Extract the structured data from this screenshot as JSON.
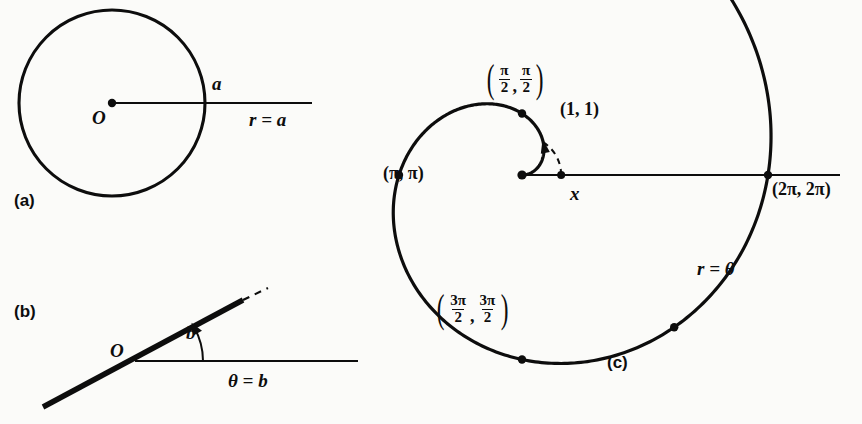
{
  "figure": {
    "caption_tags": {
      "a": "(a)",
      "b": "(b)",
      "c": "(c)"
    },
    "ink_color": "#0d0d0d",
    "paper_color": "#fbfbf9"
  },
  "panel_a": {
    "name": "circle r = a",
    "equation_label": "r = a",
    "origin_label": "O",
    "radius_label": "a",
    "geometry": {
      "center": [
        112,
        103
      ],
      "radius": 93,
      "ray_end_x": 312
    }
  },
  "panel_b": {
    "name": "line theta = b",
    "equation_label": "θ = b",
    "origin_label": "O",
    "angle_label": "b",
    "geometry": {
      "vertex": [
        135,
        361
      ],
      "line_start": [
        43,
        407
      ],
      "line_end": [
        243,
        300
      ],
      "dash_end": [
        268,
        288
      ],
      "axis_end_x": 358,
      "angle_arc_radius": 68
    }
  },
  "panel_c": {
    "name": "Archimedean spiral r = theta",
    "equation_label": "r = θ",
    "axis_label": "x",
    "geometry": {
      "origin": [
        522,
        175
      ],
      "axis_start_x": 522,
      "axis_end_x": 840,
      "pixels_per_unit": 39.15,
      "theta_start": 0.0,
      "theta_end": 7.0
    },
    "point_labels": {
      "one_one": "(1, 1)",
      "pi_pi": "(π, π)",
      "two_pi": "(2π, 2π)",
      "half_pi": {
        "num1": "π",
        "den1": "2",
        "num2": "π",
        "den2": "2"
      },
      "three_half_pi": {
        "num1": "3π",
        "den1": "2",
        "num2": "3π",
        "den2": "2"
      }
    },
    "marked_points": [
      {
        "name": "origin",
        "theta": 0.0,
        "label": null
      },
      {
        "name": "half-pi",
        "theta": 1.5707963,
        "label": "(pi/2, pi/2)"
      },
      {
        "name": "pi",
        "theta": 3.1415927,
        "label": "(pi, pi)"
      },
      {
        "name": "three-half-pi",
        "theta": 4.712389,
        "label": "(3pi/2, 3pi/2)"
      },
      {
        "name": "five-quarter-turn",
        "theta": 5.4977871,
        "label": null
      },
      {
        "name": "two-pi",
        "theta": 6.2831853,
        "label": "(2pi, 2pi)"
      }
    ],
    "dashed_arc": {
      "name": "unit arc from (1,1) to x-axis",
      "radius_units": 1.0,
      "from_theta": 1.0,
      "to_theta": 0.0
    }
  },
  "chart_data": {
    "type": "line",
    "panels": [
      {
        "tag": "(a)",
        "equation": "r = a",
        "curve": "circle of radius a centered at the pole O",
        "annotations": [
          "O",
          "a",
          "r = a"
        ]
      },
      {
        "tag": "(b)",
        "equation": "θ = b",
        "curve": "straight line through the pole O making angle b with the polar axis",
        "annotations": [
          "O",
          "b",
          "θ = b"
        ]
      },
      {
        "tag": "(c)",
        "equation": "r = θ",
        "curve": "Archimedean spiral",
        "annotations": [
          "(1, 1)",
          "(π/2, π/2)",
          "(π, π)",
          "(3π/2, 3π/2)",
          "(2π, 2π)",
          "r = θ",
          "x"
        ],
        "sampled_points": [
          {
            "theta": 0.0,
            "r": 0.0
          },
          {
            "theta": 1.0,
            "r": 1.0
          },
          {
            "theta": 1.5707963,
            "r": 1.5707963
          },
          {
            "theta": 3.1415927,
            "r": 3.1415927
          },
          {
            "theta": 4.712389,
            "r": 4.712389
          },
          {
            "theta": 6.2831853,
            "r": 6.2831853
          },
          {
            "theta": 7.0,
            "r": 7.0
          }
        ]
      }
    ]
  }
}
